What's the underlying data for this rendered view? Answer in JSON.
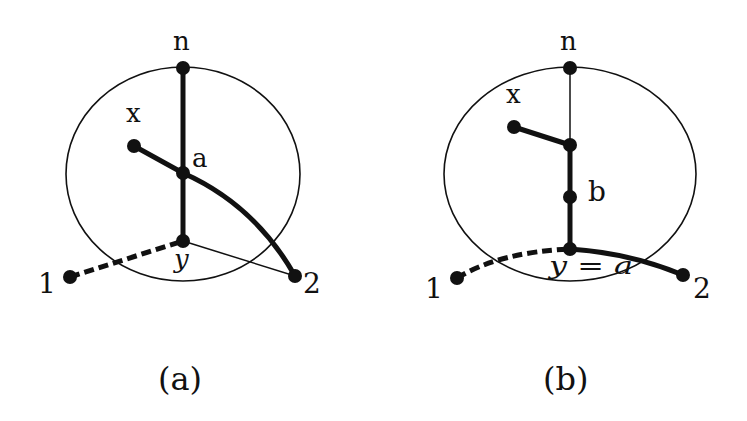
{
  "figure": {
    "panels": [
      {
        "id": "a",
        "caption": "(a)",
        "labels": {
          "n": "n",
          "x": "x",
          "a": "a",
          "y": "y",
          "one": "1",
          "two": "2"
        },
        "nodes": [
          "n",
          "a",
          "y",
          "x",
          "1",
          "2"
        ],
        "edges": [
          {
            "from": "n",
            "to": "a",
            "style": "thick"
          },
          {
            "from": "a",
            "to": "y",
            "style": "thick"
          },
          {
            "from": "x",
            "to": "a",
            "style": "thick"
          },
          {
            "from": "a",
            "to": "2",
            "style": "thick-curve"
          },
          {
            "from": "1",
            "to": "y",
            "style": "thick-dashed"
          },
          {
            "from": "y",
            "to": "2",
            "style": "thin"
          }
        ]
      },
      {
        "id": "b",
        "caption": "(b)",
        "labels": {
          "n": "n",
          "x": "x",
          "b": "b",
          "ya": "y = a",
          "one": "1",
          "two": "2"
        },
        "nodes": [
          "n",
          "x",
          "junction",
          "b",
          "y=a",
          "1",
          "2"
        ],
        "edges": [
          {
            "from": "n",
            "to": "junction",
            "style": "thin"
          },
          {
            "from": "x",
            "to": "junction",
            "style": "thick"
          },
          {
            "from": "junction",
            "to": "b",
            "style": "thick"
          },
          {
            "from": "b",
            "to": "y=a",
            "style": "thick"
          },
          {
            "from": "1",
            "to": "y=a",
            "style": "thick-dashed-curve"
          },
          {
            "from": "y=a",
            "to": "2",
            "style": "thick-curve"
          }
        ]
      }
    ],
    "colors": {
      "stroke": "#111111",
      "background": "#ffffff"
    }
  }
}
